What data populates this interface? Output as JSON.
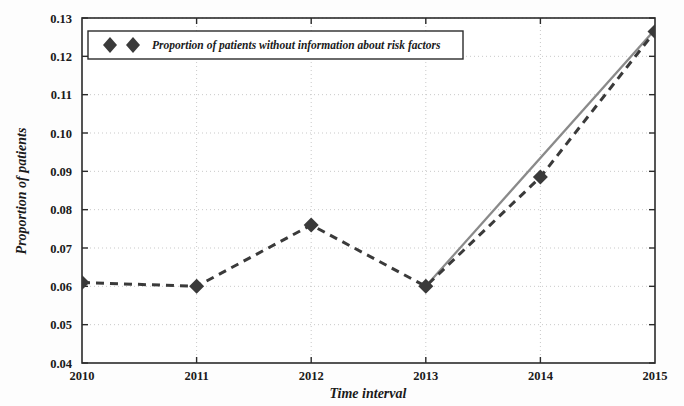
{
  "chart_data": {
    "type": "line",
    "title": "",
    "xlabel": "Time interval",
    "ylabel": "Proportion of patients",
    "x": [
      2010,
      2011,
      2012,
      2013,
      2014,
      2015
    ],
    "xtick_labels": [
      "2010",
      "2011",
      "2012",
      "2013",
      "2014",
      "2015"
    ],
    "ytick_labels": [
      "0.04",
      "0.05",
      "0.06",
      "0.07",
      "0.08",
      "0.09",
      "0.10",
      "0.11",
      "0.12",
      "0.13"
    ],
    "ytick_values": [
      0.04,
      0.05,
      0.06,
      0.07,
      0.08,
      0.09,
      0.1,
      0.11,
      0.12,
      0.13
    ],
    "xlim": [
      2010,
      2015
    ],
    "ylim": [
      0.04,
      0.13
    ],
    "grid": true,
    "legend_position": "top-left",
    "series": [
      {
        "name": "Proportion of patients without information about risk factors",
        "values": [
          0.061,
          0.06,
          0.076,
          0.06,
          0.0885,
          0.1265
        ],
        "style": "dashed",
        "marker": "diamond",
        "color": "#3a3a3a"
      },
      {
        "name": "trend-overlay",
        "x": [
          2013,
          2015
        ],
        "values": [
          0.06,
          0.127
        ],
        "style": "solid",
        "marker": "none",
        "color": "#8a8a8a"
      }
    ]
  },
  "legend": {
    "entries": [
      {
        "label": "Proportion of patients without information about risk factors",
        "marker": "diamond-marker"
      }
    ]
  },
  "axes": {
    "x_title": "Time interval",
    "y_title": "Proportion of patients"
  }
}
